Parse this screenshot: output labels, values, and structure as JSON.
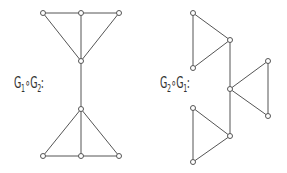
{
  "labels": {
    "left": {
      "g1": "G",
      "s1": "1",
      "op": "∘",
      "g2": "G",
      "s2": "2",
      "colon": ":"
    },
    "right": {
      "g1": "G",
      "s1": "2",
      "op": "∘",
      "g2": "G",
      "s2": "1",
      "colon": ":"
    }
  },
  "colors": {
    "edge": "#555555",
    "node_fill": "#ffffff",
    "node_stroke": "#555555"
  },
  "graphs": [
    {
      "name": "G1∘G2",
      "nodes": [
        [
          43,
          13
        ],
        [
          81,
          13
        ],
        [
          119,
          13
        ],
        [
          81,
          61
        ],
        [
          81,
          109
        ],
        [
          43,
          156
        ],
        [
          81,
          156
        ],
        [
          119,
          156
        ]
      ],
      "edges": [
        [
          0,
          1
        ],
        [
          1,
          2
        ],
        [
          0,
          3
        ],
        [
          1,
          3
        ],
        [
          2,
          3
        ],
        [
          3,
          4
        ],
        [
          4,
          5
        ],
        [
          4,
          6
        ],
        [
          4,
          7
        ],
        [
          5,
          6
        ],
        [
          6,
          7
        ]
      ]
    },
    {
      "name": "G2∘G1",
      "nodes": [
        [
          193,
          13
        ],
        [
          230,
          40
        ],
        [
          193,
          68
        ],
        [
          230,
          89
        ],
        [
          268,
          61
        ],
        [
          268,
          116
        ],
        [
          193,
          108
        ],
        [
          230,
          136
        ],
        [
          193,
          162
        ]
      ],
      "edges": [
        [
          0,
          1
        ],
        [
          1,
          2
        ],
        [
          0,
          2
        ],
        [
          1,
          3
        ],
        [
          3,
          4
        ],
        [
          3,
          5
        ],
        [
          4,
          5
        ],
        [
          3,
          7
        ],
        [
          6,
          7
        ],
        [
          7,
          8
        ],
        [
          6,
          8
        ]
      ]
    }
  ]
}
